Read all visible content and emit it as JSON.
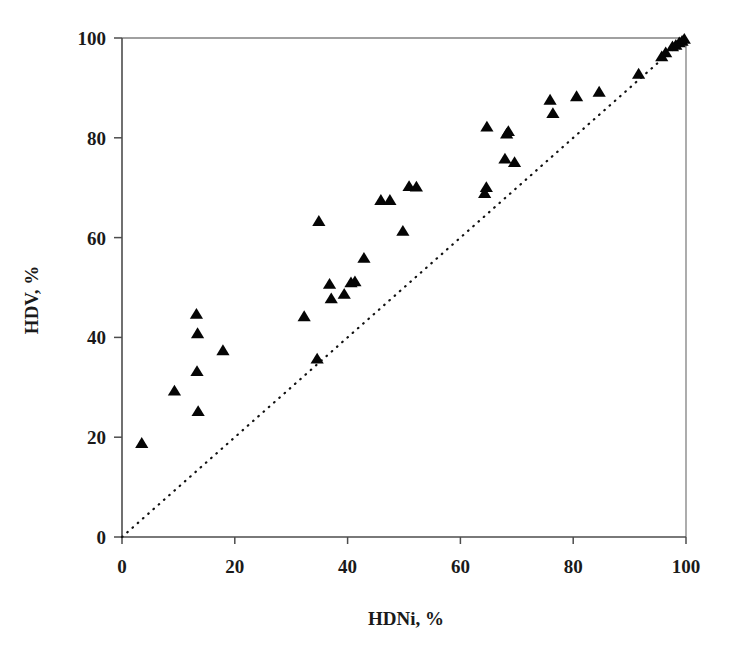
{
  "chart_data": {
    "type": "scatter",
    "title": "",
    "xlabel": "HDNi, %",
    "ylabel": "HDV, %",
    "xlim": [
      0,
      100
    ],
    "ylim": [
      0,
      100
    ],
    "xticks": [
      0,
      20,
      40,
      60,
      80,
      100
    ],
    "yticks": [
      0,
      20,
      40,
      60,
      80,
      100
    ],
    "xtick_labels": [
      "0",
      "20",
      "40",
      "60",
      "80",
      "100"
    ],
    "ytick_labels": [
      "0",
      "20",
      "40",
      "60",
      "80",
      "100"
    ],
    "grid": false,
    "legend": null,
    "marker": "triangle-up",
    "marker_color": "#050505",
    "reference_line": {
      "name": "parity-line",
      "style": "dotted",
      "from": [
        0,
        0
      ],
      "to": [
        100,
        100
      ],
      "color": "#111111"
    },
    "series": [
      {
        "name": "HDV vs HDNi",
        "points": [
          [
            3.5,
            18.8
          ],
          [
            9.3,
            29.3
          ],
          [
            13.2,
            44.7
          ],
          [
            13.4,
            40.8
          ],
          [
            13.3,
            33.2
          ],
          [
            13.5,
            25.2
          ],
          [
            17.9,
            37.4
          ],
          [
            32.3,
            44.2
          ],
          [
            34.6,
            35.7
          ],
          [
            34.9,
            63.3
          ],
          [
            36.8,
            50.7
          ],
          [
            37.1,
            47.8
          ],
          [
            39.4,
            48.7
          ],
          [
            40.6,
            51.0
          ],
          [
            41.3,
            51.2
          ],
          [
            42.9,
            55.9
          ],
          [
            45.9,
            67.5
          ],
          [
            47.5,
            67.5
          ],
          [
            49.8,
            61.3
          ],
          [
            50.9,
            70.3
          ],
          [
            52.2,
            70.2
          ],
          [
            64.3,
            68.9
          ],
          [
            64.6,
            70.1
          ],
          [
            64.7,
            82.2
          ],
          [
            68.2,
            80.8
          ],
          [
            68.5,
            81.3
          ],
          [
            67.9,
            75.8
          ],
          [
            69.6,
            75.1
          ],
          [
            75.9,
            87.6
          ],
          [
            76.4,
            84.9
          ],
          [
            80.6,
            88.3
          ],
          [
            84.6,
            89.2
          ],
          [
            91.6,
            92.8
          ],
          [
            95.7,
            96.3
          ],
          [
            96.4,
            97.1
          ],
          [
            97.6,
            98.3
          ],
          [
            98.2,
            98.6
          ],
          [
            98.8,
            99.1
          ],
          [
            99.3,
            99.4
          ],
          [
            99.7,
            99.8
          ]
        ]
      }
    ]
  },
  "axes": {
    "x_axis_name": "x-axis",
    "y_axis_name": "y-axis"
  }
}
